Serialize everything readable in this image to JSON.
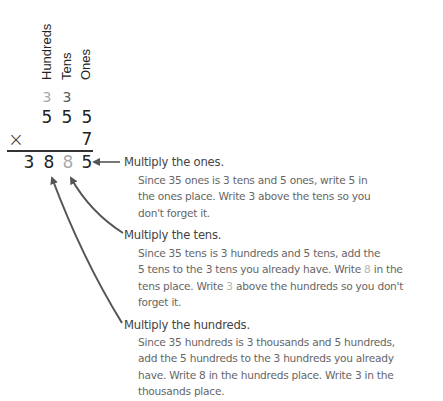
{
  "place_labels": [
    "Hundreds",
    "Tens",
    "Ones"
  ],
  "problem": {
    "carries": [
      "3",
      "3"
    ],
    "multiplicand": [
      "5",
      "5",
      "5"
    ],
    "operator": "×",
    "multiplier": "7",
    "product": [
      "3",
      "8",
      "8",
      "5"
    ]
  },
  "notes": [
    {
      "heading": "Multiply the ones.",
      "lines": [
        "Since 35 ones is 3 tens and 5 ones, write 5 in",
        "the ones place. Write 3 above the tens so you",
        "don't forget it."
      ]
    },
    {
      "heading": "Multiply the tens.",
      "lines_parts": [
        [
          "Since 35 tens is 3 hundreds and 5 tens, add the"
        ],
        [
          "5 tens to the 3 tens you already have. Write ",
          "8",
          " in the"
        ],
        [
          "tens place. Write ",
          "3",
          " above the hundreds so you don't"
        ],
        [
          "forget it."
        ]
      ]
    },
    {
      "heading": "Multiply the hundreds.",
      "lines": [
        "Since 35 hundreds is 3 thousands and 5 hundreds,",
        "add the 5 hundreds to the 3 hundreds you already",
        "have. Write 8 in the hundreds place. Write 3 in the",
        "thousands place."
      ]
    }
  ],
  "colors": {
    "ink": "#222222",
    "carry_light": "#a8a8a8",
    "carry_dark": "#5a5a5a",
    "arrow": "#555555"
  }
}
